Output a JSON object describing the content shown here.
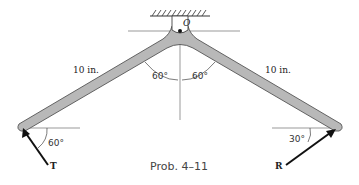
{
  "figure": {
    "caption": "Prob. 4–11",
    "pivot_label": "O",
    "left_arm_length": "10 in.",
    "right_arm_length": "10 in.",
    "left_arm_angle": "60°",
    "right_arm_angle": "60°",
    "force_T_label": "T",
    "force_T_angle": "60°",
    "force_R_label": "R",
    "force_R_angle": "30°",
    "colors": {
      "arm_fill": "#b8b8b8",
      "arm_stroke": "#555555",
      "line": "#333333"
    }
  }
}
